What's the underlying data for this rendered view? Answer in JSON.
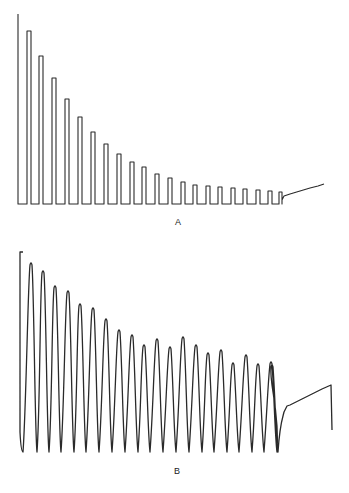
{
  "figure": {
    "panels": [
      {
        "id": "A",
        "label": "A",
        "trace_style": "square pulses",
        "baseline_y": 204,
        "start": {
          "x": 18,
          "top_y": 14
        },
        "pulses": [
          {
            "x1": 27,
            "x2": 31,
            "top": 31
          },
          {
            "x1": 39,
            "x2": 43,
            "top": 56
          },
          {
            "x1": 52,
            "x2": 56,
            "top": 78
          },
          {
            "x1": 65,
            "x2": 69,
            "top": 99
          },
          {
            "x1": 78,
            "x2": 82,
            "top": 117
          },
          {
            "x1": 91,
            "x2": 95,
            "top": 132
          },
          {
            "x1": 104,
            "x2": 108,
            "top": 144
          },
          {
            "x1": 117,
            "x2": 121,
            "top": 154
          },
          {
            "x1": 130,
            "x2": 134,
            "top": 162
          },
          {
            "x1": 142,
            "x2": 146,
            "top": 167
          },
          {
            "x1": 155,
            "x2": 159,
            "top": 174
          },
          {
            "x1": 168,
            "x2": 172,
            "top": 178
          },
          {
            "x1": 181,
            "x2": 185,
            "top": 182
          },
          {
            "x1": 193,
            "x2": 197,
            "top": 185
          },
          {
            "x1": 206,
            "x2": 210,
            "top": 186
          },
          {
            "x1": 218,
            "x2": 222,
            "top": 187
          },
          {
            "x1": 231,
            "x2": 235,
            "top": 188
          },
          {
            "x1": 243,
            "x2": 247,
            "top": 189
          },
          {
            "x1": 256,
            "x2": 260,
            "top": 190
          },
          {
            "x1": 268,
            "x2": 272,
            "top": 191
          },
          {
            "x1": 279,
            "x2": 282,
            "top": 192
          }
        ],
        "tail": [
          [
            282,
            200
          ],
          [
            284,
            196
          ],
          [
            290,
            194
          ],
          [
            300,
            191
          ],
          [
            310,
            188
          ],
          [
            318,
            186
          ],
          [
            324,
            184
          ]
        ]
      },
      {
        "id": "B",
        "label": "B",
        "trace_style": "smooth oscillations",
        "trough_y": 452,
        "start": {
          "x": 20,
          "top_y": 252
        },
        "peaks": [
          {
            "x": 31,
            "y": 262
          },
          {
            "x": 43,
            "y": 270
          },
          {
            "x": 55,
            "y": 285
          },
          {
            "x": 68,
            "y": 290
          },
          {
            "x": 80,
            "y": 303
          },
          {
            "x": 93,
            "y": 307
          },
          {
            "x": 106,
            "y": 318
          },
          {
            "x": 119,
            "y": 329
          },
          {
            "x": 132,
            "y": 334
          },
          {
            "x": 144,
            "y": 344
          },
          {
            "x": 157,
            "y": 338
          },
          {
            "x": 170,
            "y": 346
          },
          {
            "x": 183,
            "y": 336
          },
          {
            "x": 196,
            "y": 344
          },
          {
            "x": 208,
            "y": 352
          },
          {
            "x": 221,
            "y": 349
          },
          {
            "x": 233,
            "y": 362
          },
          {
            "x": 246,
            "y": 354
          },
          {
            "x": 258,
            "y": 363
          },
          {
            "x": 271,
            "y": 361
          },
          {
            "x": 272,
            "y": 364
          }
        ],
        "tail": [
          [
            282,
            452
          ],
          [
            284,
            412
          ],
          [
            287,
            406
          ],
          [
            290,
            405
          ],
          [
            300,
            400
          ],
          [
            312,
            394
          ],
          [
            322,
            389
          ],
          [
            331,
            385
          ],
          [
            332,
            430
          ]
        ]
      }
    ]
  }
}
